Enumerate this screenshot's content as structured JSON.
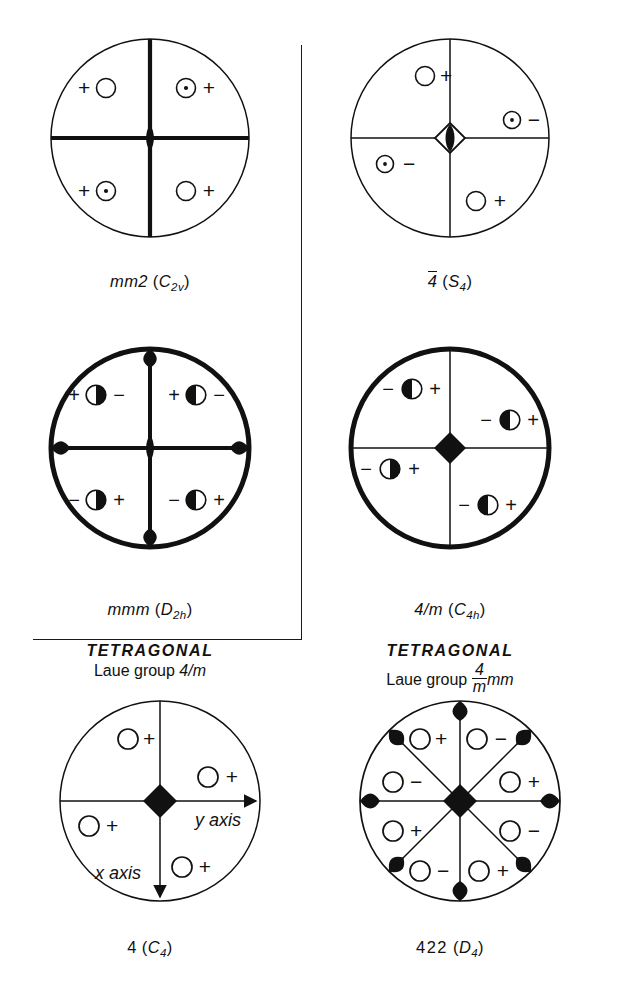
{
  "figure": {
    "type": "crystallographic-stereograms",
    "background": "#ffffff",
    "ink": "#111111",
    "bracket": {
      "present": true,
      "shape": "right-angle"
    }
  },
  "stereograms": [
    {
      "id": "mm2",
      "caption_main": "mm2",
      "caption_paren_open": " (",
      "caption_sym": "C",
      "caption_sub": "2v",
      "caption_paren_close": ")",
      "circle_weight": "thin",
      "axis_weight": "bold",
      "center_symbol": "two-fold-lens",
      "sectors": 4,
      "poles": [
        {
          "sector": "upper-left",
          "marker": "open-circle",
          "sign": "+",
          "sign_side": "left"
        },
        {
          "sector": "upper-right",
          "marker": "dotted-circle",
          "sign": "+",
          "sign_side": "right"
        },
        {
          "sector": "lower-left",
          "marker": "dotted-circle",
          "sign": "+",
          "sign_side": "left"
        },
        {
          "sector": "lower-right",
          "marker": "open-circle",
          "sign": "+",
          "sign_side": "right"
        }
      ]
    },
    {
      "id": "minus4",
      "caption_main": "4",
      "caption_overbar": true,
      "caption_paren_open": " (",
      "caption_sym": "S",
      "caption_sub": "4",
      "caption_paren_close": ")",
      "circle_weight": "thin",
      "axis_weight": "thin",
      "center_symbol": "four-bar-diamond",
      "sectors": 4,
      "poles": [
        {
          "sector": "upper-left",
          "marker": "open-circle",
          "sign": "+",
          "sign_side": "right"
        },
        {
          "sector": "right",
          "marker": "dotted-circle",
          "sign": "−",
          "sign_side": "right"
        },
        {
          "sector": "left",
          "marker": "dotted-circle",
          "sign": "−",
          "sign_side": "right"
        },
        {
          "sector": "lower-right",
          "marker": "open-circle",
          "sign": "+",
          "sign_side": "right"
        }
      ]
    },
    {
      "id": "mmm",
      "caption_main": "mmm",
      "caption_paren_open": " (",
      "caption_sym": "D",
      "caption_sub": "2h",
      "caption_paren_close": ")",
      "circle_weight": "bold",
      "axis_weight": "bold",
      "center_symbol": "two-fold-lens",
      "edge_marks": [
        "top",
        "bottom",
        "left",
        "right"
      ],
      "sectors": 4,
      "poles": [
        {
          "sector": "upper-left",
          "marker": "half-filled-right",
          "left_sign": "+",
          "right_sign": "−"
        },
        {
          "sector": "upper-right",
          "marker": "half-filled-left",
          "left_sign": "+",
          "right_sign": "−"
        },
        {
          "sector": "lower-left",
          "marker": "half-filled-right",
          "left_sign": "−",
          "right_sign": "+"
        },
        {
          "sector": "lower-right",
          "marker": "half-filled-left",
          "left_sign": "−",
          "right_sign": "+"
        }
      ]
    },
    {
      "id": "4overm",
      "caption_main": "4/m",
      "caption_paren_open": " (",
      "caption_sym": "C",
      "caption_sub": "4h",
      "caption_paren_close": ")",
      "circle_weight": "bold",
      "axis_weight": "thin",
      "center_symbol": "filled-diamond",
      "sectors": 4,
      "poles": [
        {
          "sector": "upper-left",
          "marker": "half-filled-left",
          "left_sign": "−",
          "right_sign": "+"
        },
        {
          "sector": "right",
          "marker": "half-filled-left",
          "left_sign": "−",
          "right_sign": "+"
        },
        {
          "sector": "left",
          "marker": "half-filled-right",
          "left_sign": "−",
          "right_sign": "+"
        },
        {
          "sector": "lower-right",
          "marker": "half-filled-left",
          "left_sign": "−",
          "right_sign": "+"
        }
      ]
    },
    {
      "id": "4",
      "caption_main": "4",
      "caption_paren_open": " (",
      "caption_sym": "C",
      "caption_sub": "4",
      "caption_paren_close": ")",
      "circle_weight": "thin",
      "axis_weight": "thin",
      "center_symbol": "filled-diamond",
      "axis_arrows": true,
      "axis_label_y": "y axis",
      "axis_label_x": "x axis",
      "sectors": 4,
      "poles": [
        {
          "sector": "upper-left",
          "marker": "open-circle",
          "sign": "+",
          "sign_side": "right"
        },
        {
          "sector": "right",
          "marker": "open-circle",
          "sign": "+",
          "sign_side": "right"
        },
        {
          "sector": "left",
          "marker": "open-circle",
          "sign": "+",
          "sign_side": "right"
        },
        {
          "sector": "lower-right",
          "marker": "open-circle",
          "sign": "+",
          "sign_side": "right"
        }
      ]
    },
    {
      "id": "422",
      "caption_main": "422",
      "caption_paren_open": " (",
      "caption_sym": "D",
      "caption_sub": "4",
      "caption_paren_close": ")",
      "circle_weight": "thin",
      "axis_weight": "thin",
      "center_symbol": "filled-diamond",
      "sectors": 8,
      "edge_marks": [
        "top",
        "bottom",
        "left",
        "right",
        "ne",
        "nw",
        "se",
        "sw"
      ],
      "poles": [
        {
          "sector": "n-left",
          "marker": "open-circle",
          "sign": "+",
          "sign_side": "right"
        },
        {
          "sector": "n-right",
          "marker": "open-circle",
          "sign": "−",
          "sign_side": "right"
        },
        {
          "sector": "w-upper",
          "marker": "open-circle",
          "sign": "−",
          "sign_side": "right"
        },
        {
          "sector": "e-upper",
          "marker": "open-circle",
          "sign": "+",
          "sign_side": "right"
        },
        {
          "sector": "w-lower",
          "marker": "open-circle",
          "sign": "+",
          "sign_side": "right"
        },
        {
          "sector": "e-lower",
          "marker": "open-circle",
          "sign": "−",
          "sign_side": "right"
        },
        {
          "sector": "s-left",
          "marker": "open-circle",
          "sign": "−",
          "sign_side": "right"
        },
        {
          "sector": "s-right",
          "marker": "open-circle",
          "sign": "+",
          "sign_side": "right"
        }
      ]
    }
  ],
  "laue_labels": [
    {
      "id": "laue-left",
      "system": "TETRAGONAL",
      "prefix": "Laue group ",
      "group_plain": "4/m",
      "fraction": null,
      "suffix": ""
    },
    {
      "id": "laue-right",
      "system": "TETRAGONAL",
      "prefix": "Laue group ",
      "group_plain": null,
      "fraction": {
        "numerator": "4",
        "denominator": "m"
      },
      "suffix": "mm"
    }
  ]
}
